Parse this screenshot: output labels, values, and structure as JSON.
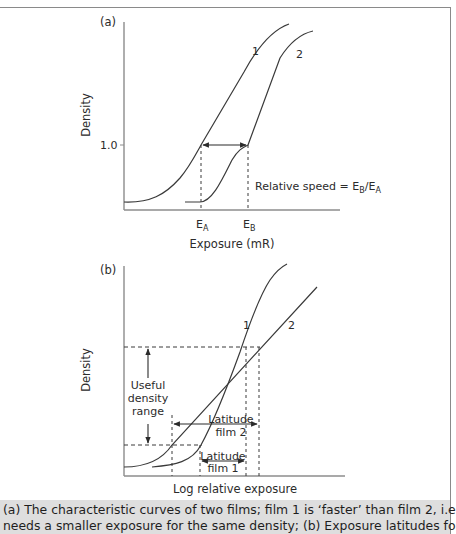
{
  "panel_a": {
    "tag": "(a)",
    "y_label": "Density",
    "y_tick": "1.0",
    "x_label": "Exposure (mR)",
    "marker_a": "E",
    "marker_a_sub": "A",
    "marker_b": "E",
    "marker_b_sub": "B",
    "curve_1_label": "1",
    "curve_2_label": "2",
    "annotation_prefix": "Relative speed = E",
    "annotation_sub_1": "B",
    "annotation_mid": "/E",
    "annotation_sub_2": "A"
  },
  "panel_b": {
    "tag": "(b)",
    "y_label": "Density",
    "x_label": "Log relative exposure",
    "curve_1_label": "1",
    "curve_2_label": "2",
    "useful_range_line1": "Useful",
    "useful_range_line2": "density",
    "useful_range_line3": "range",
    "latitude2_line1": "Latitude",
    "latitude2_line2": "film 2",
    "latitude1_line1": "Latitude",
    "latitude1_line2": "film 1"
  },
  "caption": {
    "line1": "(a) The characteristic curves of two films; film 1 is ‘faster’ than film 2, i.e. film 1",
    "line2": "needs a smaller exposure for the same density; (b) Exposure latitudes for two"
  },
  "colors": {
    "line": "#3a3a3a",
    "axis": "#8c8c8c",
    "caption_bg": "#dedede",
    "frame": "#8a8a8a"
  }
}
